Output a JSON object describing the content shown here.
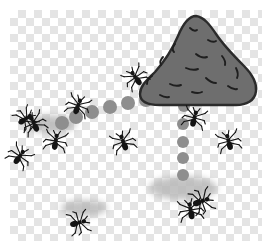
{
  "scene": {
    "title": "Ant colony with anthill mounds and foraging trails",
    "canvas": {
      "width": 272,
      "height": 251,
      "background": "#ffffff"
    },
    "checkerboard": {
      "name": "transparency-checkerboard",
      "x": 10,
      "y": 10,
      "width": 252,
      "height": 231,
      "square_size": 8,
      "light_color": "#ffffff",
      "dark_color": "#e4e4e4"
    },
    "colors": {
      "mound_fill": "#6e6e6e",
      "mound_outline": "#2b2b2b",
      "mound_debris": "#1f1f1f",
      "soft_mound": "#b9b9b9",
      "trail_dot": "#8e8e8e",
      "ant_body": "#141414"
    },
    "big_mound": {
      "name": "large-anthill-mound",
      "label": "Large anthill",
      "center_x": 198,
      "center_y": 62,
      "width": 118,
      "height": 92,
      "fill": "#6e6e6e",
      "outline": "#2b2b2b",
      "debris_marks": 14
    },
    "soft_mounds": [
      {
        "name": "soft-mound-left",
        "label": "Small mound (left)",
        "x": 50,
        "y": 124,
        "rx": 26,
        "ry": 9
      },
      {
        "name": "soft-mound-right",
        "label": "Small mound (lower right)",
        "x": 183,
        "y": 188,
        "rx": 34,
        "ry": 12
      },
      {
        "name": "soft-mound-bottom",
        "label": "Faint mound (bottom left)",
        "x": 84,
        "y": 208,
        "rx": 23,
        "ry": 8
      }
    ],
    "trails": [
      {
        "name": "diagonal-trail",
        "label": "Diagonal foraging trail",
        "dots": [
          {
            "x": 146,
            "y": 100,
            "r": 7
          },
          {
            "x": 128,
            "y": 103,
            "r": 7
          },
          {
            "x": 110,
            "y": 107,
            "r": 7
          },
          {
            "x": 92,
            "y": 112,
            "r": 7
          },
          {
            "x": 76,
            "y": 117,
            "r": 7
          },
          {
            "x": 62,
            "y": 123,
            "r": 7
          }
        ]
      },
      {
        "name": "vertical-trail",
        "label": "Vertical foraging trail",
        "dots": [
          {
            "x": 184,
            "y": 106,
            "r": 6
          },
          {
            "x": 183,
            "y": 124,
            "r": 6
          },
          {
            "x": 183,
            "y": 142,
            "r": 6
          },
          {
            "x": 183,
            "y": 158,
            "r": 6
          },
          {
            "x": 183,
            "y": 175,
            "r": 6
          }
        ]
      }
    ],
    "ants": [
      {
        "name": "ant-1",
        "label": "Ant near large mound",
        "x": 131,
        "y": 88,
        "rotation": -35,
        "scale": 1.0
      },
      {
        "name": "ant-2",
        "label": "Ant on diagonal trail",
        "x": 83,
        "y": 103,
        "rotation": 20,
        "scale": 1.0
      },
      {
        "name": "ant-3",
        "label": "Ant above left mound",
        "x": 41,
        "y": 115,
        "rotation": 55,
        "scale": 0.95
      },
      {
        "name": "ant-4",
        "label": "Ant left of left mound",
        "x": 30,
        "y": 131,
        "rotation": -25,
        "scale": 1.0
      },
      {
        "name": "ant-5",
        "label": "Ant right of left mound",
        "x": 58,
        "y": 140,
        "rotation": 10,
        "scale": 1.0
      },
      {
        "name": "ant-6",
        "label": "Ant below left mound",
        "x": 29,
        "y": 152,
        "rotation": 35,
        "scale": 1.0
      },
      {
        "name": "ant-7",
        "label": "Ant center of frame",
        "x": 120,
        "y": 148,
        "rotation": -20,
        "scale": 1.0
      },
      {
        "name": "ant-8",
        "label": "Ant right of center",
        "x": 198,
        "y": 116,
        "rotation": 15,
        "scale": 1.0
      },
      {
        "name": "ant-9",
        "label": "Ant on right edge",
        "x": 226,
        "y": 146,
        "rotation": -15,
        "scale": 1.0
      },
      {
        "name": "ant-10",
        "label": "Ant beside lower mound",
        "x": 222,
        "y": 197,
        "rotation": 70,
        "scale": 1.05
      },
      {
        "name": "ant-11",
        "label": "Ant under lower mound",
        "x": 188,
        "y": 213,
        "rotation": -10,
        "scale": 1.05
      },
      {
        "name": "ant-12",
        "label": "Ant at bottom left",
        "x": 100,
        "y": 220,
        "rotation": 75,
        "scale": 1.0
      }
    ]
  }
}
